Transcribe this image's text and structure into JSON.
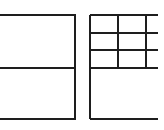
{
  "canvas": {
    "width": 164,
    "height": 130,
    "background_color": "#ffffff",
    "stroke_color": "#1e1e1e",
    "stroke_width": 2
  },
  "figures": [
    {
      "name": "left-divided-rectangle",
      "description": "rectangle clipped at left image edge, split into two equal horizontal halves",
      "lines": [
        {
          "x1": 0,
          "y1": 15,
          "x2": 76,
          "y2": 15
        },
        {
          "x1": 0,
          "y1": 68,
          "x2": 76,
          "y2": 68
        },
        {
          "x1": 0,
          "y1": 119,
          "x2": 76,
          "y2": 119
        },
        {
          "x1": 75,
          "y1": 15,
          "x2": 75,
          "y2": 119
        }
      ]
    },
    {
      "name": "right-grid-rectangle",
      "description": "rectangle clipped at right image edge, top half a 3-column 3-row grid, bottom half a single open cell",
      "lines": [
        {
          "x1": 90,
          "y1": 15,
          "x2": 90,
          "y2": 119
        },
        {
          "x1": 118,
          "y1": 15,
          "x2": 118,
          "y2": 68
        },
        {
          "x1": 146,
          "y1": 15,
          "x2": 146,
          "y2": 68
        },
        {
          "x1": 90,
          "y1": 15,
          "x2": 158,
          "y2": 15
        },
        {
          "x1": 90,
          "y1": 33,
          "x2": 158,
          "y2": 33
        },
        {
          "x1": 90,
          "y1": 50,
          "x2": 158,
          "y2": 50
        },
        {
          "x1": 90,
          "y1": 68,
          "x2": 158,
          "y2": 68
        },
        {
          "x1": 90,
          "y1": 119,
          "x2": 158,
          "y2": 119
        }
      ]
    }
  ]
}
